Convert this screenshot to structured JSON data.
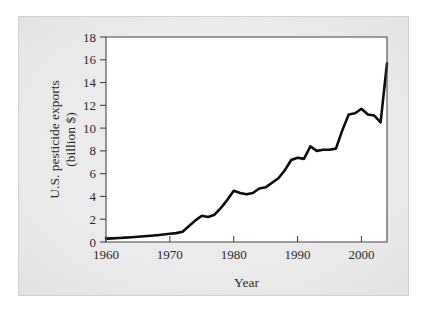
{
  "figure": {
    "background_color": "#e8e8e8",
    "plot_background_color": "#ffffff",
    "line_color": "#0d0d0d",
    "axis_color": "#454545"
  },
  "chart_data": {
    "type": "line",
    "title": "",
    "xlabel": "Year",
    "ylabel": "U.S. pesticide exports (billion $)",
    "ylabel_line1": "U.S. pesticide exports",
    "ylabel_line2": "(billion $)",
    "xlim": [
      1960,
      2004
    ],
    "ylim": [
      0,
      18
    ],
    "xticks": [
      1960,
      1970,
      1980,
      1990,
      2000
    ],
    "xtick_labels": [
      "1960",
      "1970",
      "1980",
      "1990",
      "2000"
    ],
    "yticks": [
      0,
      2,
      4,
      6,
      8,
      10,
      12,
      14,
      16,
      18
    ],
    "ytick_labels": [
      "0",
      "2",
      "4",
      "6",
      "8",
      "10",
      "12",
      "14",
      "16",
      "18"
    ],
    "grid": false,
    "legend": false,
    "series": [
      {
        "name": "U.S. pesticide exports",
        "x": [
          1960,
          1961,
          1962,
          1963,
          1964,
          1965,
          1966,
          1967,
          1968,
          1969,
          1970,
          1971,
          1972,
          1973,
          1974,
          1975,
          1976,
          1977,
          1978,
          1979,
          1980,
          1981,
          1982,
          1983,
          1984,
          1985,
          1986,
          1987,
          1988,
          1989,
          1990,
          1991,
          1992,
          1993,
          1994,
          1995,
          1996,
          1997,
          1998,
          1999,
          2000,
          2001,
          2002,
          2003,
          2004
        ],
        "values": [
          0.3,
          0.32,
          0.35,
          0.38,
          0.42,
          0.46,
          0.5,
          0.55,
          0.6,
          0.66,
          0.72,
          0.78,
          0.9,
          1.4,
          1.9,
          2.3,
          2.2,
          2.4,
          3.0,
          3.7,
          4.5,
          4.3,
          4.2,
          4.3,
          4.7,
          4.8,
          5.2,
          5.6,
          6.3,
          7.2,
          7.4,
          7.3,
          8.4,
          8.0,
          8.1,
          8.1,
          8.2,
          9.8,
          11.2,
          11.3,
          11.7,
          11.2,
          11.1,
          10.5,
          15.7
        ]
      }
    ]
  }
}
